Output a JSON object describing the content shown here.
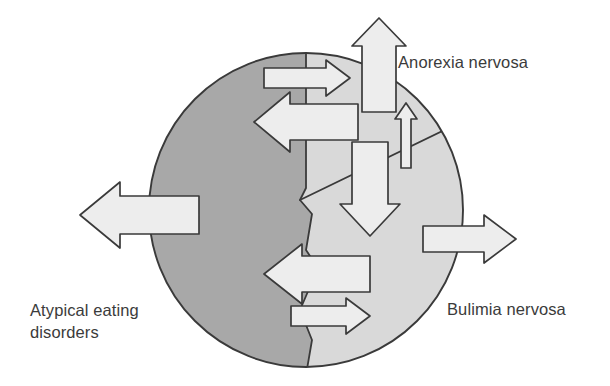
{
  "figure": {
    "kind": "venn-like-transdiagnostic-flow-diagram",
    "background_color": "#ffffff",
    "labels": {
      "anorexia": "Anorexia nervosa",
      "bulimia": "Bulimia nervosa",
      "atypical_line1": "Atypical eating",
      "atypical_line2": "disorders",
      "atypical_full": "Atypical eating\ndisorders"
    },
    "colors": {
      "dark_sector_fill": "#a8a8a8",
      "light_sector_fill": "#d9d9d9",
      "arrow_fill": "#ededed",
      "outline": "#3a3a3a",
      "text": "#3b3b3b"
    },
    "circle": {
      "center_x": 306,
      "center_y": 210,
      "radius": 157,
      "outline_width": 1.8
    },
    "regions": [
      {
        "name": "atypical-eating-disorders-region",
        "fill": "#a8a8a8",
        "label_ref": "atypical_full"
      },
      {
        "name": "anorexia-nervosa-region",
        "fill": "#d9d9d9",
        "label_ref": "anorexia"
      },
      {
        "name": "bulimia-nervosa-region",
        "fill": "#d9d9d9",
        "label_ref": "bulimia"
      }
    ],
    "arrows": [
      {
        "name": "arrow-up-out-anorexia",
        "direction": "up",
        "size": "large",
        "scope": "outbound"
      },
      {
        "name": "arrow-right-atypical-to-anorexia",
        "direction": "right",
        "size": "small",
        "scope": "internal"
      },
      {
        "name": "arrow-left-anorexia-to-atypical",
        "direction": "left",
        "size": "large",
        "scope": "internal"
      },
      {
        "name": "arrow-up-bulimia-to-anorexia",
        "direction": "up",
        "size": "thin",
        "scope": "internal"
      },
      {
        "name": "arrow-down-anorexia-to-bulimia",
        "direction": "down",
        "size": "large",
        "scope": "internal"
      },
      {
        "name": "arrow-left-out-atypical",
        "direction": "left",
        "size": "large",
        "scope": "outbound"
      },
      {
        "name": "arrow-right-out-bulimia",
        "direction": "right",
        "size": "medium",
        "scope": "outbound"
      },
      {
        "name": "arrow-left-bulimia-to-atypical",
        "direction": "left",
        "size": "large",
        "scope": "internal"
      },
      {
        "name": "arrow-right-atypical-to-bulimia",
        "direction": "right",
        "size": "small",
        "scope": "internal"
      }
    ]
  }
}
